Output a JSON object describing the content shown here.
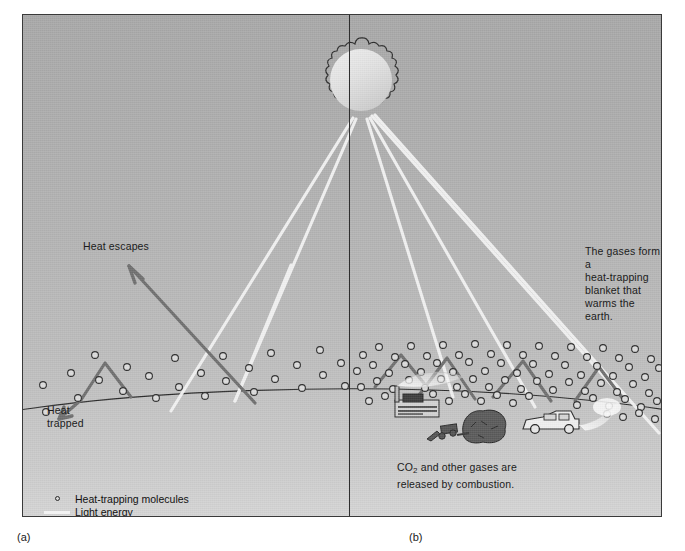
{
  "figure": {
    "panel_a_caption": "(a)",
    "panel_b_caption": "(b)"
  },
  "labels": {
    "heat_escapes": "Heat escapes",
    "heat_trapped": "Heat\ntrapped",
    "gases_blanket": "The gases form a\nheat-trapping\nblanket that\nwarms the earth.",
    "co2_combustion_line1": "CO",
    "co2_combustion_sub": "2",
    "co2_combustion_line2": " and other gases are\nreleased by combustion."
  },
  "legend": {
    "items": [
      {
        "key": "molecule-circle",
        "label": "Heat-trapping molecules"
      },
      {
        "key": "light-line",
        "label": "Light energy"
      },
      {
        "key": "heat-line",
        "label": "Heat energy"
      }
    ]
  },
  "colors": {
    "sky_top": "#a8a8a8",
    "sky_bottom": "#cfcfcf",
    "ground": "#c9c9c9",
    "light_energy": "#f4f4f4",
    "heat_energy": "#6f6f6f",
    "molecule_fill": "#dcdcdc",
    "molecule_stroke": "#2b2b2b",
    "frame_border": "#3a3a3a",
    "divider": "#2e2e2e",
    "text": "#1b1b1b"
  },
  "scene": {
    "sun": {
      "cx": 338,
      "cy": 65,
      "r": 35,
      "spikes": 22
    },
    "objects": [
      {
        "name": "factory",
        "x": 372,
        "y": 382
      },
      {
        "name": "bulldozer",
        "x": 430,
        "y": 415
      },
      {
        "name": "tree",
        "x": 455,
        "y": 408
      },
      {
        "name": "car",
        "x": 520,
        "y": 405
      }
    ]
  }
}
